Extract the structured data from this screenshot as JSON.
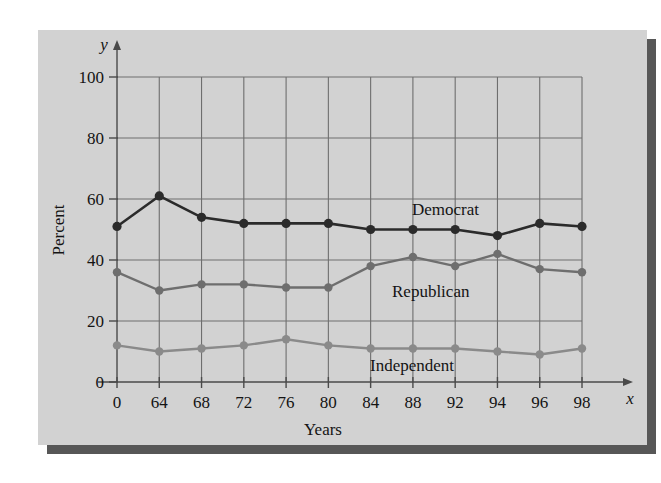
{
  "figure": {
    "panel_color": "#d2d2d2",
    "shadow_color": "#575757",
    "background": "#ffffff"
  },
  "chart_data": {
    "type": "line",
    "title": "",
    "xlabel": "Years",
    "ylabel": "Percent",
    "x_axis_symbol": "x",
    "y_axis_symbol": "y",
    "categories": [
      "0",
      "64",
      "68",
      "72",
      "76",
      "80",
      "84",
      "88",
      "92",
      "94",
      "96",
      "98"
    ],
    "xtick_labels": [
      "0",
      "64",
      "68",
      "72",
      "76",
      "80",
      "84",
      "88",
      "92",
      "94",
      "96",
      "98"
    ],
    "ytick_labels": [
      "0",
      "20",
      "40",
      "60",
      "80",
      "100"
    ],
    "yticks": [
      0,
      20,
      40,
      60,
      80,
      100
    ],
    "ylim": [
      0,
      100
    ],
    "grid": true,
    "legend_position": "inline-annotations",
    "series": [
      {
        "name": "Democrat",
        "color": "#2b2b2b",
        "marker": "circle",
        "values": [
          51,
          61,
          54,
          52,
          52,
          52,
          50,
          50,
          50,
          48,
          52,
          51
        ],
        "label_x": "92",
        "label_y": 56
      },
      {
        "name": "Republican",
        "color": "#6e6e6e",
        "marker": "circle",
        "values": [
          36,
          30,
          32,
          32,
          31,
          31,
          38,
          41,
          38,
          42,
          37,
          36
        ],
        "label_x": "88",
        "label_y": 29
      },
      {
        "name": "Independent",
        "color": "#8a8a8a",
        "marker": "circle",
        "values": [
          12,
          10,
          11,
          12,
          14,
          12,
          11,
          11,
          11,
          10,
          9,
          11
        ],
        "label_x": "90",
        "label_y": 5
      }
    ],
    "annotations": [
      {
        "text": "Democrat",
        "x_px": 412,
        "y_px": 215
      },
      {
        "text": "Republican",
        "x_px": 392,
        "y_px": 297
      },
      {
        "text": "Independent",
        "x_px": 370,
        "y_px": 371
      }
    ]
  }
}
